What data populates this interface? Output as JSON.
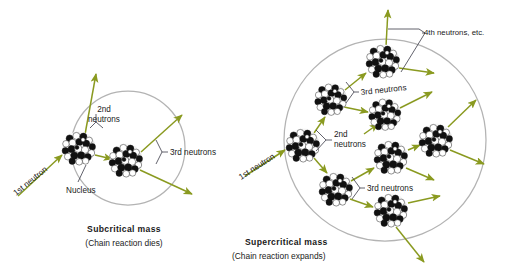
{
  "figure": {
    "colors": {
      "neutron_arrow": "#8a9a20",
      "mass_boundary": "#b3b3b3",
      "leader_line": "#3a3a46",
      "nucleon_dark": "#111111",
      "nucleon_light": "#ffffff",
      "text": "#1a1a1a",
      "background": "#ffffff"
    }
  },
  "panels": [
    {
      "id": "subcritical",
      "caption_title": "Subcritical mass",
      "caption_sub": "(Chain reaction dies)",
      "nucleus_count": 2,
      "labels": {
        "first_neutron": "1st neutron",
        "second_neutrons": "2nd\nneutrons",
        "second_neutrons_line1": "2nd",
        "second_neutrons_line2": "neutrons",
        "third_neutrons": "3rd neutrons",
        "nucleus": "Nucleus"
      },
      "boundary": {
        "cx": 128,
        "cy": 148,
        "r": 57
      },
      "nuclei": [
        {
          "id": "n1",
          "cx": 79,
          "cy": 148,
          "r": 17
        },
        {
          "id": "n2",
          "cx": 126,
          "cy": 160,
          "r": 17
        }
      ]
    },
    {
      "id": "supercritical",
      "caption_title": "Supercritical mass",
      "caption_sub": "(Chain reaction expands)",
      "nucleus_count": 8,
      "labels": {
        "first_neutron": "1st neutron",
        "second_neutrons_line1": "2nd",
        "second_neutrons_line2": "neutrons",
        "third_neutrons_upper": "3rd neutrons",
        "third_neutrons_lower": "3rd neutrons",
        "fourth_neutrons": "4th neutrons, etc."
      },
      "boundary": {
        "cx": 385,
        "cy": 140,
        "r": 101
      },
      "nuclei": [
        {
          "id": "s1",
          "cx": 303,
          "cy": 145,
          "r": 17
        },
        {
          "id": "s2",
          "cx": 331,
          "cy": 99,
          "r": 16
        },
        {
          "id": "s3",
          "cx": 336,
          "cy": 189,
          "r": 17
        },
        {
          "id": "s4",
          "cx": 383,
          "cy": 61,
          "r": 17
        },
        {
          "id": "s5",
          "cx": 385,
          "cy": 114,
          "r": 16
        },
        {
          "id": "s6",
          "cx": 391,
          "cy": 157,
          "r": 17
        },
        {
          "id": "s7",
          "cx": 391,
          "cy": 210,
          "r": 17
        },
        {
          "id": "s8",
          "cx": 436,
          "cy": 140,
          "r": 17
        }
      ]
    }
  ],
  "legend_terms": [
    "1st neutron",
    "2nd neutrons",
    "3rd neutrons",
    "4th neutrons, etc.",
    "Nucleus",
    "Subcritical mass",
    "Supercritical mass"
  ]
}
